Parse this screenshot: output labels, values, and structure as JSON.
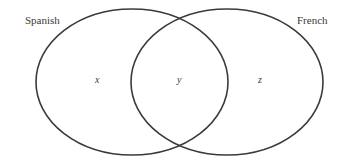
{
  "diagram": {
    "type": "venn",
    "sets": [
      {
        "name": "Spanish",
        "label": "Spanish"
      },
      {
        "name": "French",
        "label": "French"
      }
    ],
    "regions": {
      "spanish_only": "x",
      "both": "y",
      "french_only": "z"
    },
    "stroke_color": "#3a3a3a"
  }
}
